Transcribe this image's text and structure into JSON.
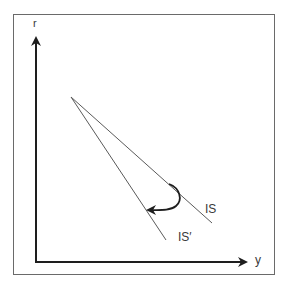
{
  "diagram": {
    "type": "IS curve shift",
    "axes": {
      "vertical_label": "r",
      "horizontal_label": "y"
    },
    "curves": [
      {
        "name": "IS",
        "label": "IS",
        "start": [
          71,
          97
        ],
        "end": [
          212,
          223
        ]
      },
      {
        "name": "IS-prime",
        "label": "IS′",
        "start": [
          71,
          97
        ],
        "end": [
          166,
          240
        ]
      }
    ],
    "shift_arrow": {
      "from_curve": "IS",
      "to_curve": "IS′",
      "direction": "rotation clockwise / steepening"
    },
    "colors": {
      "axis": "#1e1e1e",
      "curve": "#5a5a5a",
      "arrow": "#1e1e1e",
      "frame": "#6a6a6a",
      "text": "#3a3a3a"
    }
  }
}
